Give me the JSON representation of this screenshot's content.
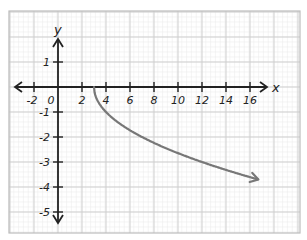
{
  "chart_data": {
    "type": "line",
    "title": "",
    "xlabel": "x",
    "ylabel": "y",
    "xlim": [
      -3,
      17.5
    ],
    "ylim": [
      -5.8,
      2.5
    ],
    "x_ticks": [
      -2,
      0,
      2,
      4,
      6,
      8,
      10,
      12,
      14,
      16
    ],
    "x_tick_labels": [
      "-2",
      "0",
      "2",
      "4",
      "6",
      "8",
      "10",
      "12",
      "14",
      "16"
    ],
    "y_ticks": [
      1,
      -1,
      -2,
      -3,
      -4,
      -5
    ],
    "y_tick_labels": [
      "1",
      "-1",
      "-2",
      "-3",
      "-4",
      "-5"
    ],
    "grid": true,
    "legend": null,
    "series": [
      {
        "name": "y = -sqrt(x - 3)",
        "color": "#777777",
        "start_point": [
          3,
          0
        ],
        "end_arrow": true,
        "x": [
          3,
          3.25,
          4,
          5,
          6,
          7,
          8,
          9,
          10,
          11,
          12,
          13,
          14,
          15,
          16,
          16.7
        ],
        "values": [
          0,
          -0.5,
          -1,
          -1.41,
          -1.73,
          -2,
          -2.24,
          -2.45,
          -2.65,
          -2.83,
          -3,
          -3.16,
          -3.32,
          -3.46,
          -3.61,
          -3.7
        ]
      }
    ]
  },
  "colors": {
    "axis": "#222222",
    "curve": "#777777",
    "grid_major": "#cfcfcf",
    "grid_minor": "#ececec",
    "border": "#bdbdbd"
  }
}
